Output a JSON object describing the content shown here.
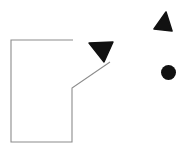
{
  "canvas": {
    "width": 189,
    "height": 153,
    "background_color": "#ffffff",
    "title": "Shape Diagram"
  },
  "palette": {
    "outline_stroke": "#8c8c8c",
    "shape_fill": "#111111",
    "background": "#ffffff"
  },
  "shapes": [
    {
      "id": "room-outline",
      "name": "room-outline-polyline",
      "type": "polyline",
      "stroke_color": "#8c8c8c",
      "stroke_width": 1.1,
      "fill": "none",
      "points": "73,40 11,40 11,142 72,142 72,88 110,62",
      "vertices": [
        {
          "x": 73,
          "y": 40,
          "label": "top-right-open-end"
        },
        {
          "x": 11,
          "y": 40,
          "label": "top-left-corner"
        },
        {
          "x": 11,
          "y": 142,
          "label": "bottom-left-corner"
        },
        {
          "x": 72,
          "y": 142,
          "label": "bottom-right-corner"
        },
        {
          "x": 72,
          "y": 88,
          "label": "notch-vertex"
        },
        {
          "x": 110,
          "y": 62,
          "label": "diagonal-end"
        }
      ]
    },
    {
      "id": "triangle-down",
      "name": "down-pointing-triangle",
      "type": "triangle",
      "fill_color": "#111111",
      "orientation": "down-right",
      "points": "89,43 113,42 104,62",
      "bbox": {
        "x": 89,
        "y": 42,
        "width": 24,
        "height": 20
      }
    },
    {
      "id": "triangle-up",
      "name": "up-pointing-triangle",
      "type": "triangle",
      "fill_color": "#111111",
      "orientation": "up",
      "points": "166,12 172,31 154,29",
      "bbox": {
        "x": 154,
        "y": 12,
        "width": 18,
        "height": 19
      }
    },
    {
      "id": "dot",
      "name": "filled-circle-dot",
      "type": "circle",
      "fill_color": "#111111",
      "center": {
        "x": 168.5,
        "y": 72.5
      },
      "radius": 7.5
    }
  ]
}
